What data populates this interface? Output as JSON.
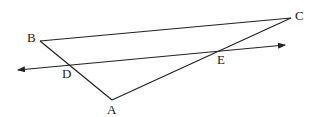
{
  "diagram": {
    "type": "geometry-triangle-with-transversal",
    "points": {
      "A": {
        "label": "A",
        "x": 112,
        "y": 100,
        "lx": 107,
        "ly": 114
      },
      "B": {
        "label": "B",
        "x": 40,
        "y": 41,
        "lx": 27,
        "ly": 42
      },
      "C": {
        "label": "C",
        "x": 291,
        "y": 18,
        "lx": 295,
        "ly": 20
      },
      "D": {
        "label": "D",
        "x": 69,
        "y": 65,
        "lx": 62,
        "ly": 78
      },
      "E": {
        "label": "E",
        "x": 222,
        "y": 51,
        "lx": 217,
        "ly": 64
      }
    },
    "segments": [
      [
        "B",
        "C"
      ],
      [
        "B",
        "A"
      ],
      [
        "A",
        "C"
      ]
    ],
    "line_DE": {
      "x1": 18,
      "y1": 70,
      "x2": 285,
      "y2": 45,
      "arrows": "both"
    },
    "stroke_color": "#222222"
  }
}
